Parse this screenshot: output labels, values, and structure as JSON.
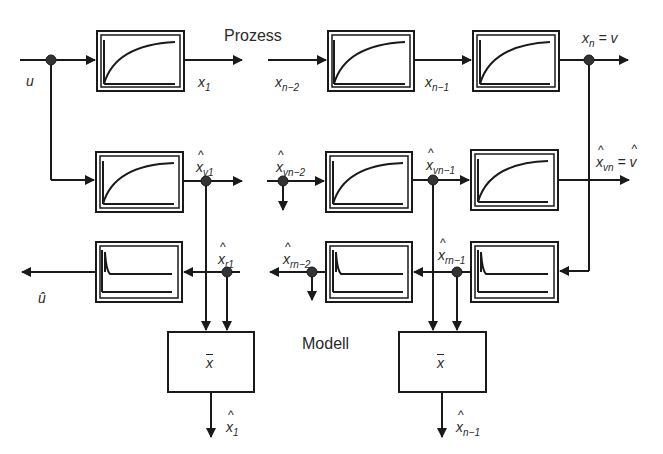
{
  "diagram": {
    "section_labels": {
      "process": "Prozess",
      "model": "Modell"
    },
    "signals": {
      "input": {
        "sym": "u",
        "sub": ""
      },
      "input_estimate": {
        "sym": "û",
        "sub": ""
      },
      "x1": {
        "sym": "x",
        "sub": "1"
      },
      "xn2": {
        "sym": "x",
        "sub": "n−2"
      },
      "xn1": {
        "sym": "x",
        "sub": "n−1"
      },
      "xn": {
        "sym": "x",
        "sub": "n",
        "eq": "= v"
      },
      "xv1": {
        "hat": "^",
        "sym": "x",
        "sub": "v1"
      },
      "xvn2": {
        "hat": "^",
        "sym": "x",
        "sub": "vn−2"
      },
      "xvn1": {
        "hat": "^",
        "sym": "x",
        "sub": "vn−1"
      },
      "xvn": {
        "hat": "^",
        "sym": "x",
        "sub": "vn",
        "eq": "=",
        "eq_hat": "^",
        "eq_sym": "v"
      },
      "xr1": {
        "hat": "^",
        "sym": "x",
        "sub": "r1"
      },
      "xrn2": {
        "hat": "^",
        "sym": "x",
        "sub": "rn−2"
      },
      "xrn1": {
        "hat": "^",
        "sym": "x",
        "sub": "rn−1"
      },
      "out1": {
        "hat": "^",
        "sym": "x",
        "sub": "1"
      },
      "outn1": {
        "hat": "^",
        "sym": "x",
        "sub": "n−1"
      }
    },
    "blocks": {
      "process": [
        "PT1 step response",
        "PT1 step response",
        "PT1 step response"
      ],
      "model_forward": [
        "PT1 step response",
        "PT1 step response",
        "PT1 step response"
      ],
      "model_reverse": [
        "impulse response",
        "impulse response",
        "impulse response"
      ],
      "averaging": [
        {
          "label": "x",
          "overline": true
        },
        {
          "label": "x",
          "overline": true
        }
      ]
    },
    "colors": {
      "line": "#1a1a1a",
      "node": "#333333",
      "text": "#2a2a2a",
      "background": "#ffffff"
    }
  }
}
